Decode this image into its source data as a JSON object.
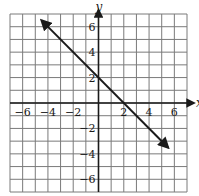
{
  "chart_data": {
    "type": "line",
    "title": "",
    "xlabel": "x",
    "ylabel": "y",
    "xlim": [
      -7,
      7
    ],
    "ylim": [
      -7,
      7
    ],
    "grid": true,
    "grid_step": 1,
    "x_ticks": [
      -6,
      -4,
      -2,
      2,
      4,
      6
    ],
    "y_ticks": [
      6,
      4,
      2,
      -2,
      -4,
      -6
    ],
    "x_tick_labels": [
      "−6",
      "−4",
      "−2",
      "2",
      "4",
      "6"
    ],
    "y_tick_labels": [
      "6",
      "4",
      "2",
      "−2",
      "−4",
      "−6"
    ],
    "series": [
      {
        "name": "line",
        "equation": "y = -x + 2",
        "slope": -1,
        "y_intercept": 2,
        "x_intercept": 2,
        "x": [
          -4.5,
          5.5
        ],
        "y": [
          6.5,
          -3.5
        ],
        "arrows": "both",
        "color": "#1a1a1a"
      }
    ],
    "legend": null
  },
  "colors": {
    "grid": "#7a7a7a",
    "axis": "#1a1a1a",
    "background": "#ffffff"
  }
}
